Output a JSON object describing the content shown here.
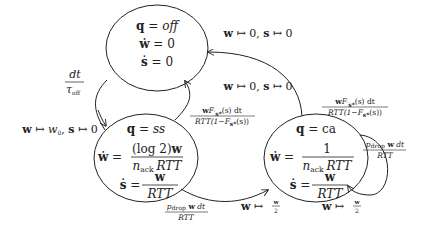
{
  "diagram": {
    "type": "state-machine",
    "states": [
      {
        "id": "off",
        "q": "off",
        "lines": [
          "q = off",
          "ẇ = 0",
          "ṡ = 0"
        ],
        "w_dot": "0",
        "s_dot": "0"
      },
      {
        "id": "ss",
        "q": "ss",
        "lines": [
          "q = ss",
          "ẇ = (log 2)w / (n_ack RTT)",
          "ṡ = w / RTT"
        ],
        "w_dot_num": "(log 2)w",
        "w_dot_den": "n_ack RTT",
        "s_dot_num": "w",
        "s_dot_den": "RTT"
      },
      {
        "id": "ca",
        "q": "ca",
        "lines": [
          "q = ca",
          "ẇ = 1 / (n_ack RTT)",
          "ṡ = w / RTT"
        ],
        "w_dot_num": "1",
        "w_dot_den": "n_ack RTT",
        "s_dot_num": "w",
        "s_dot_den": "RTT"
      }
    ],
    "transitions": [
      {
        "from": "ca",
        "to": "off",
        "reset": "w ↦ 0, s ↦ 0"
      },
      {
        "from": "ss",
        "to": "off",
        "reset": "w ↦ 0, s ↦ 0",
        "rate": "wF'_{s*}(s) dt / RTT(1−F_{s*}(s))"
      },
      {
        "from": "ca",
        "to": "off",
        "rate": "wF'_{s*}(s) dt / RTT(1−F_{s*}(s))"
      },
      {
        "from": "off",
        "to": "ss",
        "rate": "dt / τ_off"
      },
      {
        "from": "init",
        "to": "ss",
        "reset": "w ↦ w0, s ↦ 0"
      },
      {
        "from": "ss",
        "to": "ca",
        "rate": "p_drop w dt / RTT",
        "reset": "w ↦ w/2"
      },
      {
        "from": "ca",
        "to": "ca",
        "rate": "p_drop w dt / RTT",
        "reset": "w ↦ w/2"
      }
    ]
  },
  "labels": {
    "off_q": "q",
    "off_eq": " = ",
    "off_val": "off",
    "wdot": "ẇ",
    "sdot": "ṡ",
    "eq": " = ",
    "zero": "0",
    "ss_val": "ss",
    "ca_val": "ca",
    "log2w": "(log 2)",
    "w": "w",
    "one": "1",
    "n": "n",
    "ack": "ack",
    "rtt": "RTT",
    "reset_zero": "w ↦ 0, s ↦ 0",
    "reset_w": "w",
    "maps": " ↦ ",
    "zero_s": "0, ",
    "s": "s",
    "init_reset_w0": "w",
    "w0": "w",
    "w0_sub": "0",
    "half_num": "w",
    "half_den": "2",
    "dt": "dt",
    "tau": "τ",
    "tau_sub": "off",
    "pdrop_p": "p",
    "pdrop_sub": "drop",
    "pdrop_tail": " dt",
    "fprime_num": "F",
    "fprime_sub": "s*",
    "fprime_tail": "(s) dt",
    "fden_rtt": "RTT(1−F",
    "fden_tail": "(s))"
  }
}
